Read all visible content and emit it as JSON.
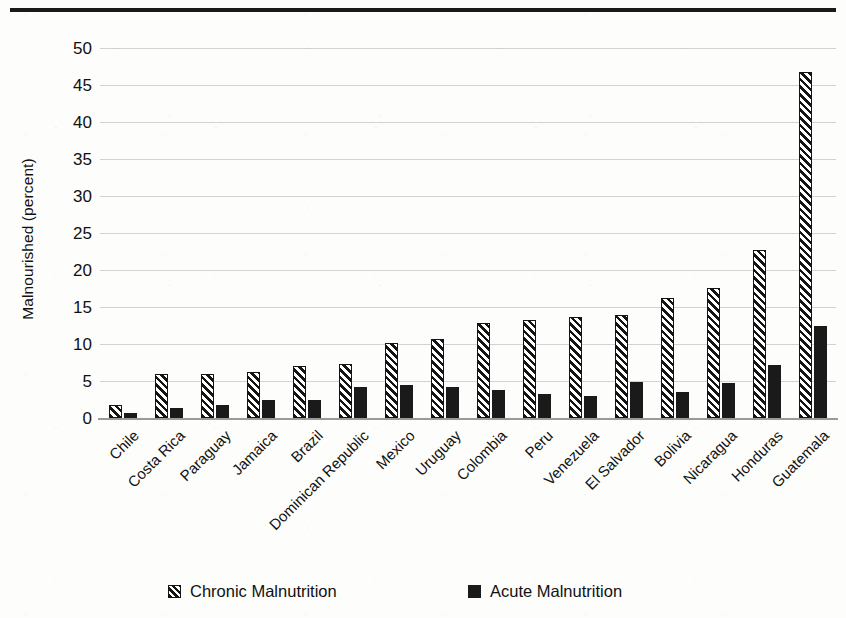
{
  "figure": {
    "top_rule_color": "#1a1a1a",
    "background_color": "#fdfdfc",
    "gridline_color": "#d2d2d2"
  },
  "chart_data": {
    "type": "bar",
    "title": "",
    "subtitle": "",
    "xlabel": "",
    "ylabel": "Malnourished (percent)",
    "ylim": [
      0,
      50
    ],
    "ytick_step": 5,
    "ytick_labels": [
      "0",
      "5",
      "10",
      "15",
      "20",
      "25",
      "30",
      "35",
      "40",
      "45",
      "50"
    ],
    "grid": true,
    "grid_axis": "y",
    "legend_position": "bottom",
    "orientation": "vertical",
    "grouping": "grouped",
    "categories": [
      "Chile",
      "Costa Rica",
      "Paraguay",
      "Jamaica",
      "Brazil",
      "Dominican Republic",
      "Mexico",
      "Uruguay",
      "Colombia",
      "Peru",
      "Venezuela",
      "El Salvador",
      "Bolivia",
      "Nicaragua",
      "Honduras",
      "Guatemala"
    ],
    "series": [
      {
        "name": "Chronic Malnutrition",
        "pattern": "diagonal-hatch",
        "color": "#141414",
        "values": [
          1.8,
          6.0,
          6.0,
          6.2,
          7.0,
          7.3,
          10.2,
          10.7,
          12.8,
          13.3,
          13.6,
          13.9,
          16.2,
          17.6,
          22.7,
          46.8
        ]
      },
      {
        "name": "Acute Malnutrition",
        "pattern": "solid",
        "color": "#1a1a1a",
        "values": [
          0.7,
          1.3,
          1.7,
          2.5,
          2.5,
          4.2,
          4.5,
          4.2,
          3.8,
          3.2,
          3.0,
          4.9,
          3.5,
          4.7,
          7.2,
          12.4
        ]
      }
    ]
  },
  "legend": {
    "items": [
      {
        "label": "Chronic Malnutrition",
        "marker": "hatched-square-swatch"
      },
      {
        "label": "Acute Malnutrition",
        "marker": "solid-square-swatch"
      }
    ]
  }
}
